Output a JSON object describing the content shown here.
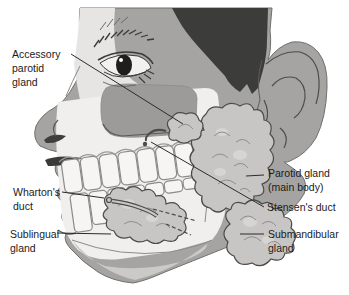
{
  "figure": {
    "type": "anatomical-diagram"
  },
  "labels": {
    "accessory_parotid": "Accessory\nparotid\ngland",
    "whartons_duct": "Wharton's\nduct",
    "sublingual": "Sublingual\ngland",
    "parotid_main": "Parotid gland\n(main body)",
    "stensens_duct": "Stensen's duct",
    "submandibular": "Submandibular\ngland"
  },
  "colors": {
    "background": "#ffffff",
    "skin_shadow": "#a5a4a2",
    "cheek_mass": "#9c9b99",
    "skin_light": "#e6e5e3",
    "hair": "#3c3c3a",
    "mouth_cutaway": "#f0efed",
    "jaw_light": "#cbcac8",
    "teeth": "#f6f5f3",
    "gland_fill": "#c7c6c4",
    "gland_outline": "#4b4b49",
    "leader_line": "#2b2b29",
    "label_text": "#1b1b1b"
  }
}
